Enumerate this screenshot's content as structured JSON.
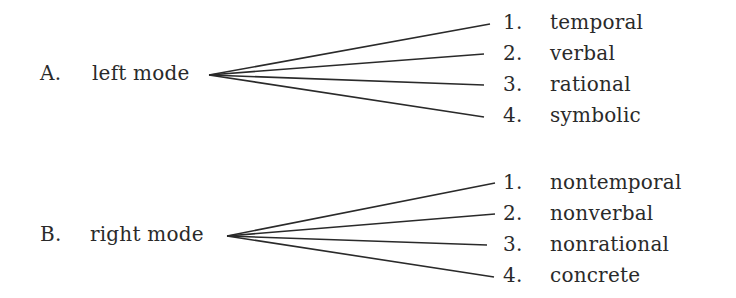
{
  "groups": [
    {
      "letter": "A.",
      "mode": "left mode",
      "items": [
        {
          "num": "1.",
          "label": "temporal"
        },
        {
          "num": "2.",
          "label": "verbal"
        },
        {
          "num": "3.",
          "label": "rational"
        },
        {
          "num": "4.",
          "label": "symbolic"
        }
      ]
    },
    {
      "letter": "B.",
      "mode": "right mode",
      "items": [
        {
          "num": "1.",
          "label": "nontemporal"
        },
        {
          "num": "2.",
          "label": "nonverbal"
        },
        {
          "num": "3.",
          "label": "nonrational"
        },
        {
          "num": "4.",
          "label": "concrete"
        }
      ]
    }
  ],
  "colors": {
    "text": "#2a2a2a",
    "line": "#2a2a2a",
    "background": "#ffffff"
  }
}
